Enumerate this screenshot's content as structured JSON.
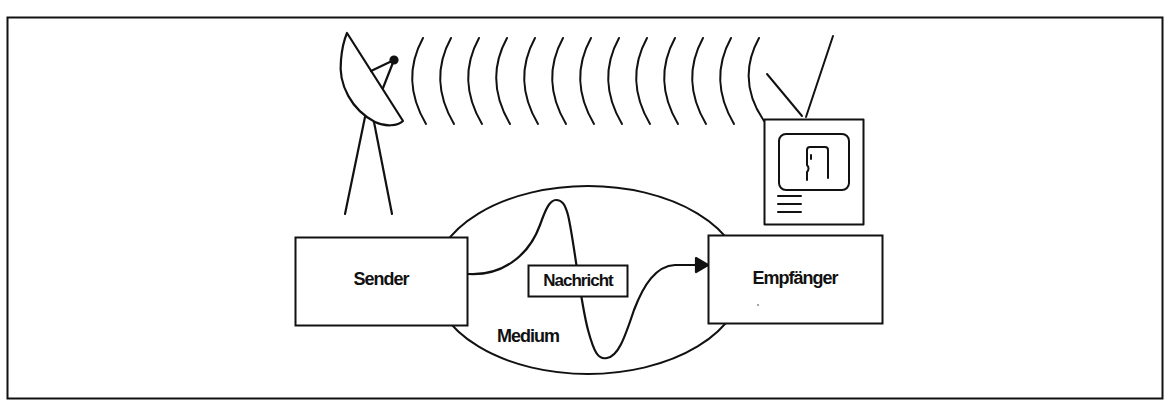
{
  "diagram": {
    "title": "",
    "type": "communication-model",
    "colors": {
      "stroke": "#111111",
      "background": "#ffffff"
    },
    "nodes": {
      "sender": {
        "label": "Sender",
        "icon": "satellite-dish-icon"
      },
      "receiver": {
        "label": "Empfänger",
        "icon": "television-icon"
      },
      "message": {
        "label": "Nachricht"
      },
      "medium": {
        "label": "Medium"
      }
    },
    "signal_waves": {
      "count": 13,
      "icon": "radio-wave-icon"
    },
    "edges": [
      {
        "from": "Sender",
        "to": "Empfänger",
        "via": "Nachricht",
        "style": "wave-arrow"
      }
    ]
  }
}
